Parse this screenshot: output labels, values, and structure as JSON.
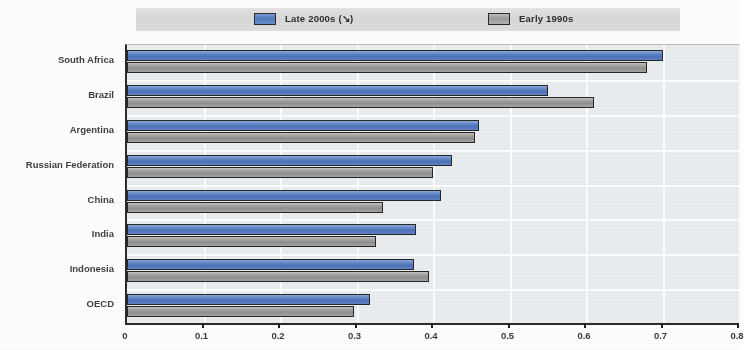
{
  "chart_data": {
    "type": "bar",
    "orientation": "horizontal",
    "title": "",
    "subtitle": "",
    "xlabel": "",
    "ylabel": "",
    "xlim": [
      0,
      0.8
    ],
    "ylim": null,
    "grid": true,
    "legend_position": "top",
    "categories": [
      "South Africa",
      "Brazil",
      "Argentina",
      "Russian Federation",
      "China",
      "India",
      "Indonesia",
      "OECD"
    ],
    "series": [
      {
        "name": "Late 2000s (↘)",
        "color": "#4a71b9",
        "values": [
          0.7,
          0.55,
          0.46,
          0.425,
          0.41,
          0.378,
          0.375,
          0.318
        ]
      },
      {
        "name": "Early 1990s",
        "color": "#8e8e8c",
        "values": [
          0.68,
          0.61,
          0.455,
          0.4,
          0.335,
          0.325,
          0.395,
          0.297
        ]
      }
    ],
    "x_ticks": [
      0,
      0.1,
      0.2,
      0.3,
      0.4,
      0.5,
      0.6,
      0.7,
      0.8
    ],
    "x_tick_labels": [
      "0",
      "0.1",
      "0.2",
      "0.3",
      "0.4",
      "0.5",
      "0.6",
      "0.7",
      "0.8"
    ]
  },
  "legend": {
    "items": [
      {
        "label": "Late 2000s (↘)",
        "swatch": "blue-swatch-icon"
      },
      {
        "label": "Early 1990s",
        "swatch": "gray-swatch-icon"
      }
    ]
  },
  "colors": {
    "series_late_2000s": "#4a71b9",
    "series_early_1990s": "#8e8e8c",
    "plot_background": "#e9ecee",
    "gridline": "#fbfcfc",
    "axis": "#2b2b2b",
    "legend_band": "#dcdcdc",
    "text": "#3f3f3f"
  }
}
